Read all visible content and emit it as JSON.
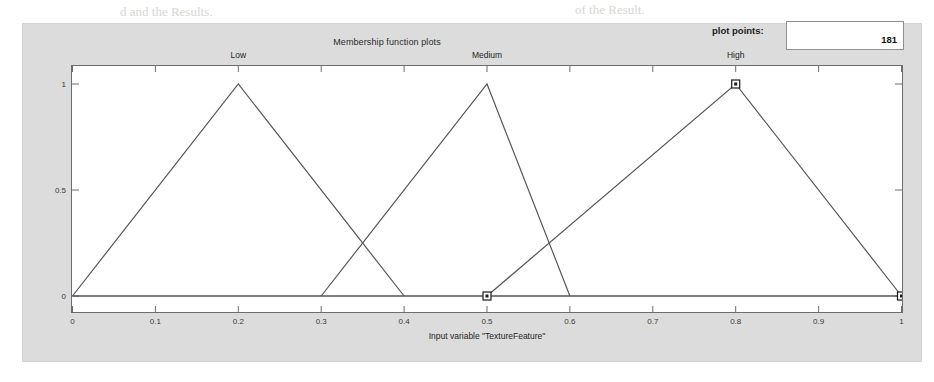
{
  "panel": {
    "title": "Membership function plots",
    "plot_points_label": "plot points:",
    "plot_points_value": "181",
    "background_color": "#dcdcdc"
  },
  "axis": {
    "x_label": "Input variable \"TextureFeature\"",
    "x_ticks": [
      "0",
      "0.1",
      "0.2",
      "0.3",
      "0.4",
      "0.5",
      "0.6",
      "0.7",
      "0.8",
      "0.9",
      "1"
    ],
    "y_ticks": [
      "0",
      "0.5",
      "1"
    ]
  },
  "chart_data": {
    "type": "line",
    "title": "Membership function plots",
    "xlabel": "Input variable \"TextureFeature\"",
    "ylabel": "",
    "xlim": [
      0,
      1
    ],
    "ylim": [
      0,
      1
    ],
    "grid": false,
    "legend": "inline-labels-above-peaks",
    "xticks": [
      0,
      0.1,
      0.2,
      0.3,
      0.4,
      0.5,
      0.6,
      0.7,
      0.8,
      0.9,
      1
    ],
    "yticks": [
      0,
      0.5,
      1
    ],
    "line_color": "#555555",
    "series": [
      {
        "name": "Low",
        "shape": "trimf",
        "params": [
          0,
          0.2,
          0.4
        ],
        "label_x": 0.2,
        "points": [
          [
            0,
            0
          ],
          [
            0.2,
            1
          ],
          [
            0.4,
            0
          ]
        ]
      },
      {
        "name": "Medium",
        "shape": "trimf",
        "params": [
          0.3,
          0.5,
          0.6
        ],
        "label_x": 0.5,
        "points": [
          [
            0.3,
            0
          ],
          [
            0.5,
            1
          ],
          [
            0.6,
            0
          ]
        ]
      },
      {
        "name": "High",
        "shape": "trimf",
        "params": [
          0.5,
          0.8,
          1
        ],
        "label_x": 0.8,
        "selected": true,
        "points": [
          [
            0.5,
            0
          ],
          [
            0.8,
            1
          ],
          [
            1,
            0
          ]
        ]
      }
    ],
    "selection_handles": [
      [
        0.5,
        0
      ],
      [
        0.8,
        1
      ],
      [
        1,
        0
      ]
    ],
    "baseline": {
      "y": 0,
      "x_from": 0,
      "x_to": 1
    }
  },
  "bleed_text": [
    {
      "text": "d and the Results.",
      "x": 120,
      "y": 4,
      "size": 13
    },
    {
      "text": "of the Result.",
      "x": 575,
      "y": 2,
      "size": 13
    },
    {
      "text": "ed and Texture Feature is Medium and Shape feature is Low",
      "x": 24,
      "y": 26,
      "size": 14
    },
    {
      "text": "en Result is Suspicious Lesion.",
      "x": 24,
      "y": 48,
      "size": 14
    },
    {
      "text": "Hair color is Light and Texture Feature is Medium and Shape Feature is Reduc",
      "x": 24,
      "y": 72,
      "size": 14
    },
    {
      "text": "en Result is Not a Cut?",
      "x": 24,
      "y": 96,
      "size": 14
    },
    {
      "text": "The rule base is shown in Figure 6.",
      "x": 24,
      "y": 134,
      "size": 14
    }
  ]
}
